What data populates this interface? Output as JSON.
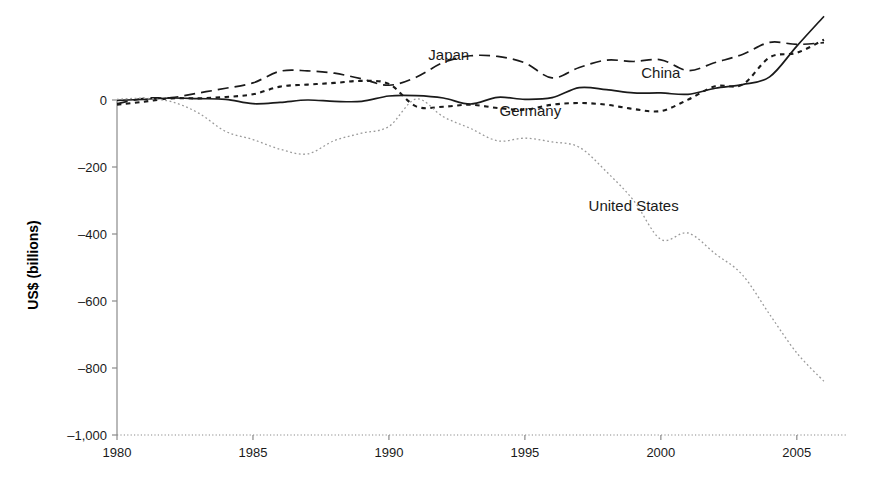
{
  "chart_data": {
    "type": "line",
    "title": "",
    "subtitle": "",
    "xlabel": "",
    "ylabel": "US$ (billions)",
    "xlim": [
      1980,
      2006
    ],
    "ylim": [
      -1000,
      100
    ],
    "grid": false,
    "legend_position": "inline-annotations",
    "x_ticks": [
      "1980",
      "1985",
      "1990",
      "1995",
      "2000",
      "2005"
    ],
    "x_tick_values": [
      1980,
      1985,
      1990,
      1995,
      2000,
      2005
    ],
    "y_ticks": [
      "0",
      "–200",
      "–400",
      "–600",
      "–800",
      "–1,000"
    ],
    "y_tick_values": [
      0,
      -200,
      -400,
      -600,
      -800,
      -1000
    ],
    "x": [
      1980,
      1981,
      1982,
      1983,
      1984,
      1985,
      1986,
      1987,
      1988,
      1989,
      1990,
      1991,
      1992,
      1993,
      1994,
      1995,
      1996,
      1997,
      1998,
      1999,
      2000,
      2001,
      2002,
      2003,
      2004,
      2005,
      2006
    ],
    "series": [
      {
        "name": "Japan",
        "style": "long-dash",
        "color": "#1a1a1a",
        "label_x": 1992.2,
        "label_y": 118,
        "values": [
          -11,
          5,
          7,
          21,
          35,
          51,
          86,
          87,
          80,
          63,
          44,
          68,
          112,
          132,
          130,
          111,
          66,
          97,
          119,
          115,
          120,
          88,
          112,
          136,
          172,
          166,
          171
        ]
      },
      {
        "name": "China",
        "style": "solid",
        "color": "#1a1a1a",
        "label_x": 2000.0,
        "label_y": 66,
        "values": [
          -1,
          2,
          6,
          4,
          2,
          -11,
          -7,
          0,
          -4,
          -4,
          12,
          13,
          6,
          -12,
          8,
          2,
          7,
          37,
          31,
          21,
          21,
          17,
          35,
          46,
          69,
          161,
          250
        ]
      },
      {
        "name": "Germany",
        "style": "dotted-dash",
        "color": "#1a1a1a",
        "label_x": 1995.2,
        "label_y": -48,
        "values": [
          -14,
          -5,
          5,
          5,
          9,
          17,
          40,
          46,
          51,
          57,
          48,
          -19,
          -20,
          -14,
          -24,
          -29,
          -14,
          -9,
          -14,
          -27,
          -33,
          1,
          41,
          46,
          127,
          141,
          180
        ]
      },
      {
        "name": "United States",
        "style": "fine-dotted",
        "color": "#9a9a9a",
        "label_x": 1999.0,
        "label_y": -330,
        "values": [
          2,
          5,
          -5,
          -39,
          -94,
          -118,
          -147,
          -161,
          -121,
          -99,
          -79,
          3,
          -50,
          -85,
          -122,
          -114,
          -125,
          -141,
          -214,
          -300,
          -416,
          -397,
          -459,
          -522,
          -640,
          -755,
          -840
        ]
      }
    ]
  },
  "axis": {
    "y_title": "US$ (billions)"
  }
}
